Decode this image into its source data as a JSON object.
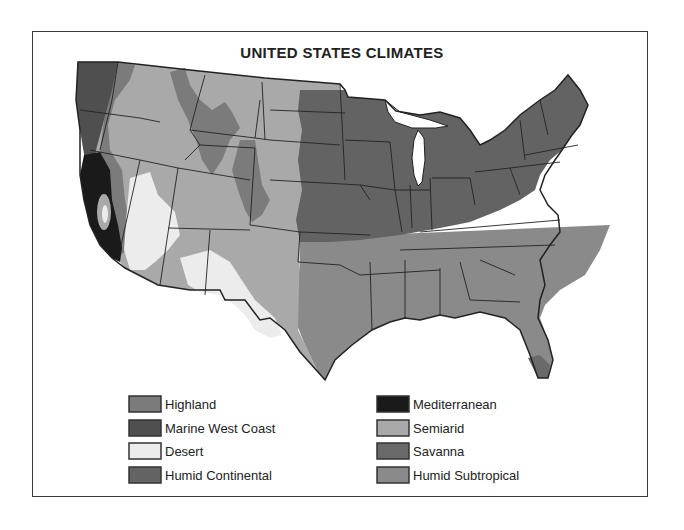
{
  "title": "UNITED STATES CLIMATES",
  "colors": {
    "highland": "#7b7b7b",
    "marine_west_coast": "#4f4f4f",
    "desert": "#ececec",
    "humid_continental": "#636363",
    "mediterranean": "#1a1a1a",
    "semiarid": "#a9a9a9",
    "savanna": "#6a6a6a",
    "humid_subtropical": "#8a8a8a",
    "border": "#222222"
  },
  "legend": {
    "left": [
      {
        "label": "Highland",
        "key": "highland"
      },
      {
        "label": "Marine West Coast",
        "key": "marine_west_coast"
      },
      {
        "label": "Desert",
        "key": "desert"
      },
      {
        "label": "Humid Continental",
        "key": "humid_continental"
      }
    ],
    "right": [
      {
        "label": "Mediterranean",
        "key": "mediterranean"
      },
      {
        "label": "Semiarid",
        "key": "semiarid"
      },
      {
        "label": "Savanna",
        "key": "savanna"
      },
      {
        "label": "Humid Subtropical",
        "key": "humid_subtropical"
      }
    ]
  }
}
